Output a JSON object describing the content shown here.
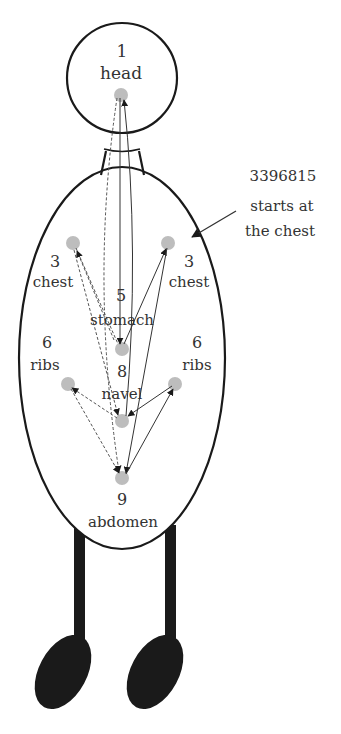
{
  "figure": {
    "type": "body-meridian-diagram",
    "colors": {
      "outline": "#1a1a1a",
      "dot": "#bdbdbd",
      "arrow": "#333333",
      "text": "#333333"
    }
  },
  "labels": {
    "head": {
      "number": "1",
      "name": "head"
    },
    "chest_left": {
      "number": "3",
      "name": "chest"
    },
    "chest_right": {
      "number": "3",
      "name": "chest"
    },
    "stomach": {
      "number": "5",
      "name": "stomach"
    },
    "ribs_left": {
      "number": "6",
      "name": "ribs"
    },
    "ribs_right": {
      "number": "6",
      "name": "ribs"
    },
    "navel": {
      "number": "8",
      "name": "navel"
    },
    "abdomen": {
      "number": "9",
      "name": "abdomen"
    }
  },
  "annotation": {
    "line1": "3396815",
    "line2": "starts at",
    "line3": "the chest"
  },
  "sequence": [
    "3",
    "3",
    "9",
    "6",
    "8",
    "1",
    "5"
  ],
  "arrows": [
    {
      "from": "head",
      "to": "stomach",
      "style": "solid"
    },
    {
      "from": "stomach",
      "to": "chest_right",
      "style": "solid"
    },
    {
      "from": "chest_right",
      "to": "abdomen",
      "style": "solid"
    },
    {
      "from": "abdomen",
      "to": "ribs_right",
      "style": "solid"
    },
    {
      "from": "ribs_right",
      "to": "navel",
      "style": "solid"
    },
    {
      "from": "navel",
      "to": "head",
      "style": "solid"
    },
    {
      "from": "head",
      "to": "abdomen",
      "style": "dashed"
    },
    {
      "from": "chest_left",
      "to": "stomach",
      "style": "dashed"
    },
    {
      "from": "stomach",
      "to": "chest_left",
      "style": "dashed"
    },
    {
      "from": "chest_left",
      "to": "navel",
      "style": "dashed"
    },
    {
      "from": "navel",
      "to": "ribs_left",
      "style": "dashed"
    },
    {
      "from": "ribs_left",
      "to": "abdomen",
      "style": "dashed"
    }
  ]
}
